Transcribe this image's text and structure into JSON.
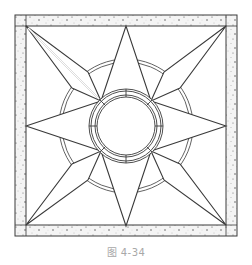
{
  "figure": {
    "caption": "图 4-34",
    "colors": {
      "line": "#3a3a3a",
      "border_fill": "#f2f2f2",
      "background": "#ffffff",
      "caption": "#a8a8a8"
    }
  }
}
